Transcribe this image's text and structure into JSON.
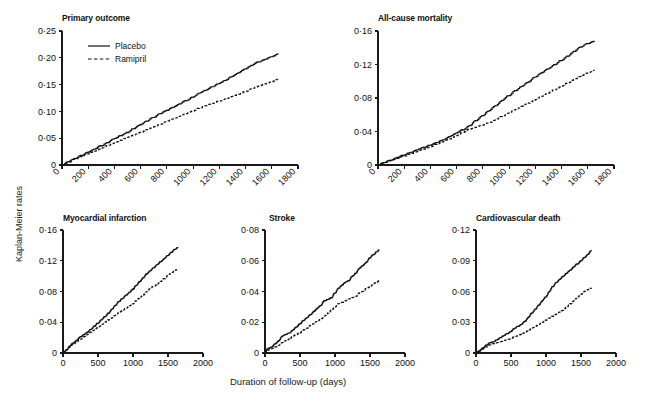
{
  "figure": {
    "y_axis_label": "Kaplan-Meier rates",
    "x_axis_label": "Duration of follow-up (days)",
    "caption": "",
    "legend": [
      {
        "label": "Placebo",
        "style": "solid"
      },
      {
        "label": "Ramipril",
        "style": "dashed"
      }
    ]
  },
  "chart_data": [
    {
      "type": "line",
      "title": "Primary outcome",
      "xlabel": "Duration of follow-up (days)",
      "ylabel": "Kaplan-Meier rates",
      "xlim": [
        0,
        1800
      ],
      "ylim": [
        0,
        0.25
      ],
      "xticks": [
        0,
        200,
        400,
        600,
        800,
        1000,
        1200,
        1400,
        1600,
        1800
      ],
      "xticklabels": [
        "0",
        "200",
        "400",
        "600",
        "800",
        "1000",
        "1200",
        "1400",
        "1600",
        "1800"
      ],
      "xtick_rotated": true,
      "yticks": [
        0,
        0.05,
        0.1,
        0.15,
        0.2,
        0.25
      ],
      "yticklabels": [
        "0",
        "0·05",
        "0·10",
        "0·15",
        "0·20",
        "0·25"
      ],
      "grid": false,
      "legend_position": "upper-left",
      "series": [
        {
          "name": "Placebo",
          "style": "solid",
          "x": [
            0,
            50,
            100,
            150,
            200,
            250,
            300,
            350,
            400,
            450,
            500,
            550,
            600,
            650,
            700,
            750,
            800,
            850,
            900,
            950,
            1000,
            1050,
            1100,
            1150,
            1200,
            1250,
            1300,
            1350,
            1400,
            1450,
            1500,
            1550,
            1600,
            1650
          ],
          "values": [
            0,
            0.006,
            0.012,
            0.018,
            0.024,
            0.03,
            0.036,
            0.042,
            0.049,
            0.055,
            0.061,
            0.068,
            0.075,
            0.082,
            0.089,
            0.096,
            0.102,
            0.108,
            0.114,
            0.12,
            0.127,
            0.134,
            0.14,
            0.146,
            0.152,
            0.158,
            0.165,
            0.172,
            0.179,
            0.186,
            0.192,
            0.197,
            0.202,
            0.207
          ]
        },
        {
          "name": "Ramipril",
          "style": "dashed",
          "x": [
            0,
            50,
            100,
            150,
            200,
            250,
            300,
            350,
            400,
            450,
            500,
            550,
            600,
            650,
            700,
            750,
            800,
            850,
            900,
            950,
            1000,
            1050,
            1100,
            1150,
            1200,
            1250,
            1300,
            1350,
            1400,
            1450,
            1500,
            1550,
            1600,
            1650
          ],
          "values": [
            0,
            0.005,
            0.011,
            0.016,
            0.021,
            0.026,
            0.031,
            0.036,
            0.041,
            0.046,
            0.051,
            0.056,
            0.061,
            0.066,
            0.071,
            0.076,
            0.081,
            0.086,
            0.091,
            0.096,
            0.101,
            0.106,
            0.111,
            0.115,
            0.119,
            0.123,
            0.128,
            0.132,
            0.137,
            0.142,
            0.147,
            0.151,
            0.155,
            0.16
          ]
        }
      ]
    },
    {
      "type": "line",
      "title": "All-cause mortality",
      "xlabel": "Duration of follow-up (days)",
      "ylabel": "Kaplan-Meier rates",
      "xlim": [
        0,
        1800
      ],
      "ylim": [
        0,
        0.16
      ],
      "xticks": [
        0,
        200,
        400,
        600,
        800,
        1000,
        1200,
        1400,
        1600,
        1800
      ],
      "xticklabels": [
        "0",
        "200",
        "400",
        "600",
        "800",
        "1000",
        "1200",
        "1400",
        "1600",
        "1800"
      ],
      "xtick_rotated": true,
      "yticks": [
        0,
        0.04,
        0.08,
        0.12,
        0.16
      ],
      "yticklabels": [
        "0",
        "0·04",
        "0·08",
        "0·12",
        "0·16"
      ],
      "grid": false,
      "legend_position": "none",
      "series": [
        {
          "name": "Placebo",
          "style": "solid",
          "x": [
            0,
            50,
            100,
            150,
            200,
            250,
            300,
            350,
            400,
            450,
            500,
            550,
            600,
            650,
            700,
            750,
            800,
            850,
            900,
            950,
            1000,
            1050,
            1100,
            1150,
            1200,
            1250,
            1300,
            1350,
            1400,
            1450,
            1500,
            1550,
            1600,
            1650
          ],
          "values": [
            0,
            0.003,
            0.006,
            0.009,
            0.012,
            0.015,
            0.018,
            0.021,
            0.024,
            0.027,
            0.03,
            0.034,
            0.038,
            0.042,
            0.047,
            0.053,
            0.059,
            0.065,
            0.071,
            0.077,
            0.083,
            0.089,
            0.094,
            0.099,
            0.105,
            0.11,
            0.115,
            0.12,
            0.125,
            0.13,
            0.136,
            0.141,
            0.145,
            0.148
          ]
        },
        {
          "name": "Ramipril",
          "style": "dashed",
          "x": [
            0,
            50,
            100,
            150,
            200,
            250,
            300,
            350,
            400,
            450,
            500,
            550,
            600,
            650,
            700,
            750,
            800,
            850,
            900,
            950,
            1000,
            1050,
            1100,
            1150,
            1200,
            1250,
            1300,
            1350,
            1400,
            1450,
            1500,
            1550,
            1600,
            1650
          ],
          "values": [
            0,
            0.003,
            0.005,
            0.008,
            0.011,
            0.013,
            0.016,
            0.019,
            0.022,
            0.025,
            0.028,
            0.031,
            0.035,
            0.039,
            0.043,
            0.045,
            0.048,
            0.051,
            0.054,
            0.058,
            0.062,
            0.066,
            0.07,
            0.074,
            0.078,
            0.082,
            0.086,
            0.09,
            0.094,
            0.098,
            0.102,
            0.106,
            0.11,
            0.113
          ]
        }
      ]
    },
    {
      "type": "line",
      "title": "Myocardial infarction",
      "xlabel": "Duration of follow-up (days)",
      "ylabel": "Kaplan-Meier rates",
      "xlim": [
        0,
        2000
      ],
      "ylim": [
        0,
        0.16
      ],
      "xticks": [
        0,
        500,
        1000,
        1500,
        2000
      ],
      "xticklabels": [
        "0",
        "500",
        "1000",
        "1500",
        "2000"
      ],
      "xtick_rotated": false,
      "yticks": [
        0,
        0.04,
        0.08,
        0.12,
        0.16
      ],
      "yticklabels": [
        "0",
        "0·04",
        "0·08",
        "0·12",
        "0·16"
      ],
      "grid": false,
      "legend_position": "none",
      "series": [
        {
          "name": "Placebo",
          "style": "solid",
          "x": [
            0,
            50,
            100,
            150,
            200,
            250,
            300,
            350,
            400,
            450,
            500,
            550,
            600,
            650,
            700,
            750,
            800,
            850,
            900,
            950,
            1000,
            1050,
            1100,
            1150,
            1200,
            1250,
            1300,
            1350,
            1400,
            1450,
            1500,
            1550,
            1600,
            1640
          ],
          "values": [
            0,
            0.004,
            0.009,
            0.013,
            0.017,
            0.021,
            0.024,
            0.027,
            0.031,
            0.035,
            0.039,
            0.043,
            0.047,
            0.052,
            0.057,
            0.062,
            0.067,
            0.071,
            0.075,
            0.079,
            0.083,
            0.088,
            0.093,
            0.098,
            0.103,
            0.107,
            0.111,
            0.115,
            0.119,
            0.123,
            0.127,
            0.131,
            0.135,
            0.137
          ]
        },
        {
          "name": "Ramipril",
          "style": "dashed",
          "x": [
            0,
            50,
            100,
            150,
            200,
            250,
            300,
            350,
            400,
            450,
            500,
            550,
            600,
            650,
            700,
            750,
            800,
            850,
            900,
            950,
            1000,
            1050,
            1100,
            1150,
            1200,
            1250,
            1300,
            1350,
            1400,
            1450,
            1500,
            1550,
            1600,
            1630
          ],
          "values": [
            0,
            0.004,
            0.008,
            0.012,
            0.015,
            0.018,
            0.021,
            0.024,
            0.027,
            0.03,
            0.033,
            0.036,
            0.04,
            0.043,
            0.046,
            0.049,
            0.052,
            0.055,
            0.058,
            0.061,
            0.064,
            0.068,
            0.072,
            0.076,
            0.08,
            0.084,
            0.087,
            0.09,
            0.093,
            0.097,
            0.101,
            0.104,
            0.107,
            0.108
          ]
        }
      ]
    },
    {
      "type": "line",
      "title": "Stroke",
      "xlabel": "Duration of follow-up (days)",
      "ylabel": "Kaplan-Meier rates",
      "xlim": [
        0,
        2000
      ],
      "ylim": [
        0,
        0.08
      ],
      "xticks": [
        0,
        500,
        1000,
        1500,
        2000
      ],
      "xticklabels": [
        "0",
        "500",
        "1000",
        "1500",
        "2000"
      ],
      "xtick_rotated": false,
      "yticks": [
        0,
        0.02,
        0.04,
        0.06,
        0.08
      ],
      "yticklabels": [
        "0",
        "0·02",
        "0·04",
        "0·06",
        "0·08"
      ],
      "grid": false,
      "legend_position": "none",
      "series": [
        {
          "name": "Placebo",
          "style": "solid",
          "x": [
            0,
            50,
            100,
            150,
            200,
            250,
            300,
            350,
            400,
            450,
            500,
            550,
            600,
            650,
            700,
            750,
            800,
            850,
            900,
            950,
            1000,
            1050,
            1100,
            1150,
            1200,
            1250,
            1300,
            1350,
            1400,
            1450,
            1500,
            1550,
            1600,
            1630
          ],
          "values": [
            0.001,
            0.003,
            0.004,
            0.006,
            0.008,
            0.011,
            0.012,
            0.013,
            0.015,
            0.017,
            0.019,
            0.021,
            0.023,
            0.025,
            0.027,
            0.029,
            0.031,
            0.034,
            0.035,
            0.036,
            0.039,
            0.042,
            0.044,
            0.046,
            0.047,
            0.05,
            0.052,
            0.055,
            0.057,
            0.059,
            0.062,
            0.064,
            0.066,
            0.067
          ]
        },
        {
          "name": "Ramipril",
          "style": "dashed",
          "x": [
            0,
            50,
            100,
            150,
            200,
            250,
            300,
            350,
            400,
            450,
            500,
            550,
            600,
            650,
            700,
            750,
            800,
            850,
            900,
            950,
            1000,
            1050,
            1100,
            1150,
            1200,
            1250,
            1300,
            1350,
            1400,
            1450,
            1500,
            1550,
            1600,
            1630
          ],
          "values": [
            0,
            0.002,
            0.003,
            0.004,
            0.005,
            0.007,
            0.008,
            0.009,
            0.011,
            0.012,
            0.013,
            0.015,
            0.016,
            0.018,
            0.019,
            0.021,
            0.022,
            0.024,
            0.026,
            0.028,
            0.03,
            0.032,
            0.033,
            0.034,
            0.035,
            0.036,
            0.037,
            0.039,
            0.04,
            0.042,
            0.043,
            0.045,
            0.046,
            0.047
          ]
        }
      ]
    },
    {
      "type": "line",
      "title": "Cardiovascular death",
      "xlabel": "Duration of follow-up (days)",
      "ylabel": "Kaplan-Meier rates",
      "xlim": [
        0,
        2000
      ],
      "ylim": [
        0,
        0.12
      ],
      "xticks": [
        0,
        500,
        1000,
        1500,
        2000
      ],
      "xticklabels": [
        "0",
        "500",
        "1000",
        "1500",
        "2000"
      ],
      "xtick_rotated": false,
      "yticks": [
        0,
        0.03,
        0.06,
        0.09,
        0.12
      ],
      "yticklabels": [
        "0",
        "0·03",
        "0·06",
        "0·09",
        "0·12"
      ],
      "grid": false,
      "legend_position": "none",
      "series": [
        {
          "name": "Placebo",
          "style": "solid",
          "x": [
            0,
            50,
            100,
            150,
            200,
            250,
            300,
            350,
            400,
            450,
            500,
            550,
            600,
            650,
            700,
            750,
            800,
            850,
            900,
            950,
            1000,
            1050,
            1100,
            1150,
            1200,
            1250,
            1300,
            1350,
            1400,
            1450,
            1500,
            1550,
            1600,
            1650
          ],
          "values": [
            0,
            0.002,
            0.005,
            0.008,
            0.01,
            0.011,
            0.013,
            0.015,
            0.017,
            0.019,
            0.021,
            0.024,
            0.026,
            0.028,
            0.031,
            0.035,
            0.039,
            0.043,
            0.047,
            0.051,
            0.055,
            0.06,
            0.065,
            0.069,
            0.072,
            0.075,
            0.078,
            0.081,
            0.084,
            0.087,
            0.09,
            0.093,
            0.096,
            0.1
          ]
        },
        {
          "name": "Ramipril",
          "style": "dashed",
          "x": [
            0,
            50,
            100,
            150,
            200,
            250,
            300,
            350,
            400,
            450,
            500,
            550,
            600,
            650,
            700,
            750,
            800,
            850,
            900,
            950,
            1000,
            1050,
            1100,
            1150,
            1200,
            1250,
            1300,
            1350,
            1400,
            1450,
            1500,
            1550,
            1600,
            1650
          ],
          "values": [
            0,
            0.002,
            0.004,
            0.006,
            0.008,
            0.009,
            0.01,
            0.011,
            0.012,
            0.013,
            0.014,
            0.016,
            0.017,
            0.018,
            0.02,
            0.022,
            0.024,
            0.026,
            0.028,
            0.03,
            0.032,
            0.034,
            0.036,
            0.038,
            0.04,
            0.042,
            0.045,
            0.048,
            0.051,
            0.054,
            0.057,
            0.06,
            0.062,
            0.063
          ]
        }
      ]
    }
  ]
}
